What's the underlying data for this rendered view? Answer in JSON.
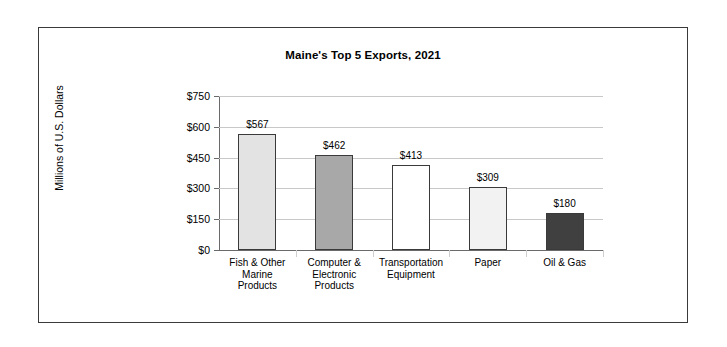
{
  "chart_data": {
    "type": "bar",
    "title": "Maine's Top 5 Exports, 2021",
    "xlabel": "",
    "ylabel": "Millions of U.S. Dollars",
    "categories": [
      "Fish & Other Marine Products",
      "Computer & Electronic Products",
      "Transportation Equipment",
      "Paper",
      "Oil & Gas"
    ],
    "category_lines": [
      [
        "Fish & Other",
        "Marine",
        "Products"
      ],
      [
        "Computer &",
        "Electronic",
        "Products"
      ],
      [
        "Transportation",
        "Equipment"
      ],
      [
        "Paper"
      ],
      [
        "Oil & Gas"
      ]
    ],
    "values": [
      567,
      462,
      413,
      309,
      180
    ],
    "data_labels": [
      "$567",
      "$462",
      "$413",
      "$309",
      "$180"
    ],
    "ylim": [
      0,
      750
    ],
    "yticks": [
      0,
      150,
      300,
      450,
      600,
      750
    ],
    "ytick_labels": [
      "$0",
      "$150",
      "$300",
      "$450",
      "$600",
      "$750"
    ],
    "grid": true,
    "legend": "none",
    "bar_colors": [
      "#e3e3e3",
      "#a8a8a8",
      "#ffffff",
      "#f2f2f2",
      "#404040"
    ],
    "bar_edge_color": "#3a3a3a",
    "gridline_color": "#c8c8c8",
    "axis_color": "#6a6a6a",
    "frame_color": "#3a3a3a",
    "background": "#ffffff"
  }
}
